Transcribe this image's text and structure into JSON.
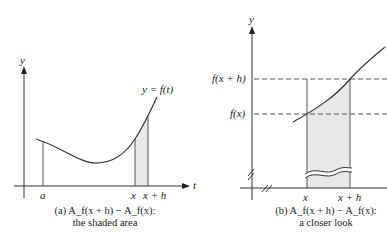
{
  "panel_a": {
    "y_axis_label": "y",
    "t_axis_label": "t",
    "curve_label": "y = f(t)",
    "tick_a": "a",
    "tick_x": "x",
    "tick_xh": "x + h",
    "caption_line1": "(a) A_f(x + h) − A_f(x):",
    "caption_line2": "the shaded area"
  },
  "panel_b": {
    "y_axis_label": "y",
    "label_fxh": "f(x + h)",
    "label_fx": "f(x)",
    "tick_x": "x",
    "tick_xh": "x + h",
    "caption_line1": "(b) A_f(x + h) − A_f(x):",
    "caption_line2": "a closer look"
  },
  "colors": {
    "shade": "#e8e8e8",
    "line": "#333333"
  }
}
